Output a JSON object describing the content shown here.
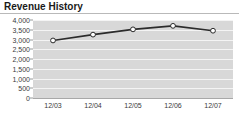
{
  "widget": {
    "title": "Revenue History"
  },
  "chart_data": {
    "type": "line",
    "title": "Revenue History",
    "xlabel": "",
    "ylabel": "",
    "categories": [
      "12/03",
      "12/04",
      "12/05",
      "12/06",
      "12/07"
    ],
    "values": [
      2950,
      3250,
      3520,
      3700,
      3450
    ],
    "series": [
      {
        "name": "Revenue",
        "values": [
          2950,
          3250,
          3520,
          3700,
          3450
        ]
      }
    ],
    "ylim": [
      0,
      4000
    ],
    "yticks": [
      0,
      500,
      1000,
      1500,
      2000,
      2500,
      3000,
      3500,
      4000
    ],
    "ytick_labels": [
      "0",
      "500",
      "1,000",
      "1,500",
      "2,000",
      "2,500",
      "3,000",
      "3,500",
      "4,000"
    ],
    "xtick_labels": [
      "12/03",
      "12/04",
      "12/05",
      "12/06",
      "12/07"
    ],
    "grid": true,
    "legend": false,
    "legend_position": "none",
    "marker": "circle",
    "colors": {
      "plot_background": "#d8d8d8",
      "gridline": "#f4f4f4",
      "line": "#2b2b2b",
      "marker_fill": "#ffffff",
      "marker_edge": "#2b2b2b",
      "axis": "#a8a8a8",
      "title_text": "#1a1a1a",
      "tick_text": "#3a3a3a",
      "rule": "#b9b9b9"
    }
  }
}
